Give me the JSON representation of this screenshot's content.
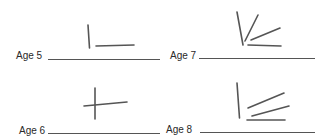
{
  "worksheet": {
    "items": [
      {
        "label": "Age 5",
        "figure": "vertical-and-horizontal-lines-separate"
      },
      {
        "label": "Age 7",
        "figure": "fan-of-diagonal-lines"
      },
      {
        "label": "Age 6",
        "figure": "cross"
      },
      {
        "label": "Age 8",
        "figure": "vertical-with-parallel-diagonals"
      }
    ]
  },
  "colors": {
    "ink": "#555555",
    "text": "#2a2a2a",
    "background": "#ffffff"
  }
}
